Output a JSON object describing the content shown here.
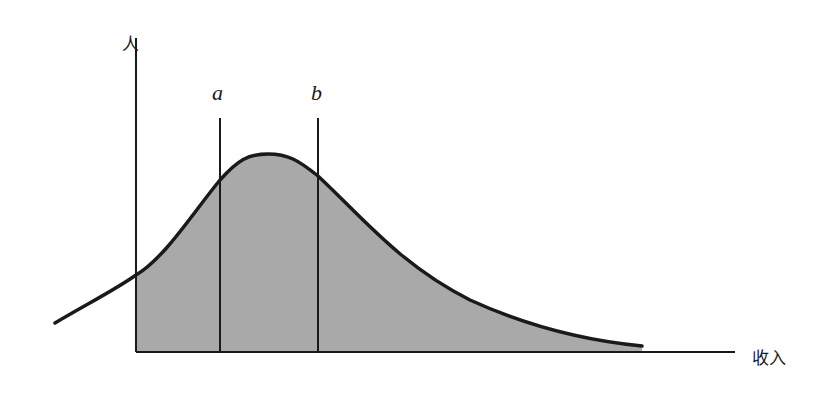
{
  "diagram": {
    "type": "income-distribution",
    "y_axis_label": "人",
    "x_axis_label": "收入",
    "markers": [
      {
        "id": "a",
        "label": "a"
      },
      {
        "id": "b",
        "label": "b"
      }
    ],
    "colors": {
      "fill": "#a9a9a9",
      "stroke": "#1a1a1a",
      "axis": "#1a1a1a",
      "background": "#ffffff"
    }
  }
}
